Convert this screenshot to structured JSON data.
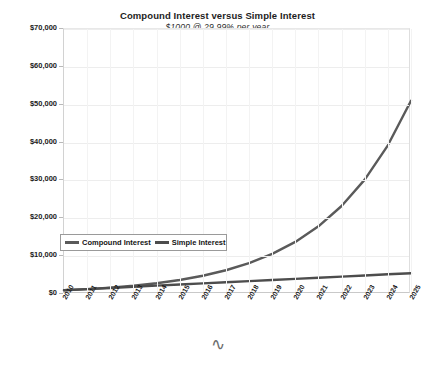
{
  "chart_data": {
    "type": "line",
    "title": "Compound Interest versus Simple Interest",
    "subtitle": "$1000 @ 29.99% per year",
    "xlabel": "",
    "ylabel": "",
    "grid": true,
    "legend_position": "inside-left",
    "categories": [
      "2010",
      "2011",
      "2012",
      "2013",
      "2014",
      "2015",
      "2016",
      "2017",
      "2018",
      "2019",
      "2020",
      "2021",
      "2022",
      "2023",
      "2024",
      "2025"
    ],
    "x": [
      2010,
      2011,
      2012,
      2013,
      2014,
      2015,
      2016,
      2017,
      2018,
      2019,
      2020,
      2021,
      2022,
      2023,
      2024,
      2025
    ],
    "ylim": [
      0,
      70000
    ],
    "ytick_values": [
      0,
      10000,
      20000,
      30000,
      40000,
      50000,
      60000,
      70000
    ],
    "ytick_labels": [
      "$0",
      "$10,000",
      "$20,000",
      "$30,000",
      "$40,000",
      "$50,000",
      "$60,000",
      "$70,000"
    ],
    "series": [
      {
        "name": "Compound Interest",
        "color": "#5a5a5a",
        "values": [
          1000,
          1300,
          1690,
          2196,
          2854,
          3710,
          4822,
          6267,
          8145,
          10586,
          13760,
          17886,
          23247,
          30217,
          39279,
          51056
        ]
      },
      {
        "name": "Simple Interest",
        "color": "#4d4d4d",
        "values": [
          1000,
          1300,
          1600,
          1900,
          2200,
          2500,
          2800,
          3100,
          3400,
          3700,
          4000,
          4300,
          4600,
          4900,
          5200,
          5500
        ]
      }
    ]
  },
  "legend": {
    "entries": [
      {
        "label": "Compound Interest"
      },
      {
        "label": "Simple Interest"
      }
    ]
  },
  "ornament": {
    "glyph": "∿"
  }
}
